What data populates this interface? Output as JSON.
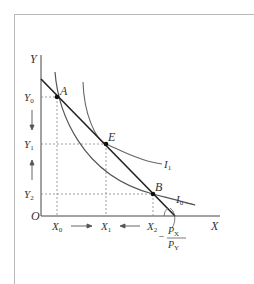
{
  "diagram": {
    "type": "indifference-curve-budget-line",
    "axes": {
      "x_label": "X",
      "y_label": "Y",
      "origin_label": "O"
    },
    "points": [
      {
        "label": "A",
        "x": 57,
        "y": 97
      },
      {
        "label": "E",
        "x": 106,
        "y": 144
      },
      {
        "label": "B",
        "x": 153,
        "y": 194
      }
    ],
    "y_ticks": [
      {
        "base": "Y",
        "sub": "0",
        "y": 97
      },
      {
        "base": "Y",
        "sub": "1",
        "y": 144
      },
      {
        "base": "Y",
        "sub": "2",
        "y": 194
      }
    ],
    "x_ticks": [
      {
        "base": "X",
        "sub": "0",
        "x": 57
      },
      {
        "base": "X",
        "sub": "1",
        "x": 106
      },
      {
        "base": "X",
        "sub": "2",
        "x": 153
      }
    ],
    "curves": [
      {
        "label_base": "I",
        "label_sub": "1"
      },
      {
        "label_base": "I",
        "label_sub": "0"
      }
    ],
    "slope_label": {
      "sign": "−",
      "numerator_base": "P",
      "numerator_sub": "X",
      "denominator_base": "P",
      "denominator_sub": "Y"
    },
    "colors": {
      "budget_line": "#222222",
      "curves": "#555555",
      "guides": "#888888",
      "frame": "#b8b8b8"
    }
  }
}
